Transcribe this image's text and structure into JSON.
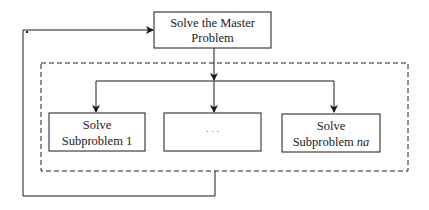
{
  "diagram": {
    "master": {
      "line1": "Solve the Master",
      "line2": "Problem"
    },
    "subproblems": [
      {
        "line1": "Solve",
        "line2": "Subproblem 1",
        "italic_suffix": ""
      },
      {
        "line1": "· · ·",
        "line2": "",
        "italic_suffix": ""
      },
      {
        "line1": "Solve",
        "line2": "Subproblem ",
        "italic_suffix": "na"
      }
    ],
    "colors": {
      "stroke": "#1a1a1a",
      "background": "#ffffff"
    }
  }
}
